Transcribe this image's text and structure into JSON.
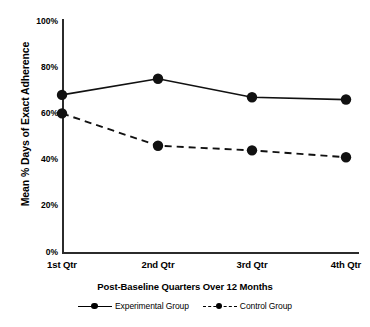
{
  "chart_data": {
    "type": "line",
    "title": "",
    "xlabel": "Post-Baseline Quarters Over 12 Months",
    "ylabel": "Mean % Days of Exact Adherence",
    "categories": [
      "1st Qtr",
      "2nd Qtr",
      "3rd Qtr",
      "4th Qtr"
    ],
    "ylim": [
      0,
      100
    ],
    "yticks": [
      "0%",
      "20%",
      "40%",
      "60%",
      "80%",
      "100%"
    ],
    "ytick_values": [
      0,
      20,
      40,
      60,
      80,
      100
    ],
    "grid": false,
    "legend_position": "bottom",
    "series": [
      {
        "name": "Experimental Group",
        "style": "solid",
        "marker": "circle",
        "values": [
          68,
          75,
          67,
          66
        ]
      },
      {
        "name": "Control Group",
        "style": "dashed",
        "marker": "circle",
        "values": [
          60,
          46,
          44,
          41
        ]
      }
    ]
  },
  "axes": {
    "y_title": "Mean % Days of Exact Adherence",
    "x_title": "Post-Baseline Quarters Over 12 Months"
  },
  "legend": {
    "items": [
      {
        "label": "Experimental Group",
        "style": "solid"
      },
      {
        "label": "Control Group",
        "style": "dashed"
      }
    ]
  },
  "colors": {
    "line": "#111111",
    "axis": "#2b2b2b",
    "background": "#ffffff"
  }
}
